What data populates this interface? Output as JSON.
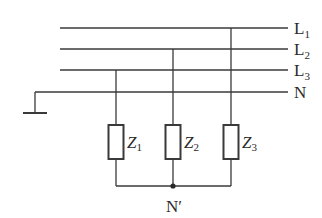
{
  "diagram": {
    "type": "three-phase four-wire circuit with star-connected load",
    "lines": [
      {
        "name": "L",
        "sub": "1",
        "y": 28
      },
      {
        "name": "L",
        "sub": "2",
        "y": 49
      },
      {
        "name": "L",
        "sub": "3",
        "y": 70
      },
      {
        "name": "N",
        "sub": "",
        "y": 92
      }
    ],
    "loads": [
      {
        "name": "Z",
        "sub": "1",
        "x": 116,
        "connected_to": "L3"
      },
      {
        "name": "Z",
        "sub": "2",
        "x": 173,
        "connected_to": "L2"
      },
      {
        "name": "Z",
        "sub": "3",
        "x": 231,
        "connected_to": "L1"
      }
    ],
    "neutral_point_label": "N′",
    "ground": true,
    "colors": {
      "wire": "#3a3a3a",
      "text": "#2a2a2a",
      "background": "#ffffff"
    }
  }
}
